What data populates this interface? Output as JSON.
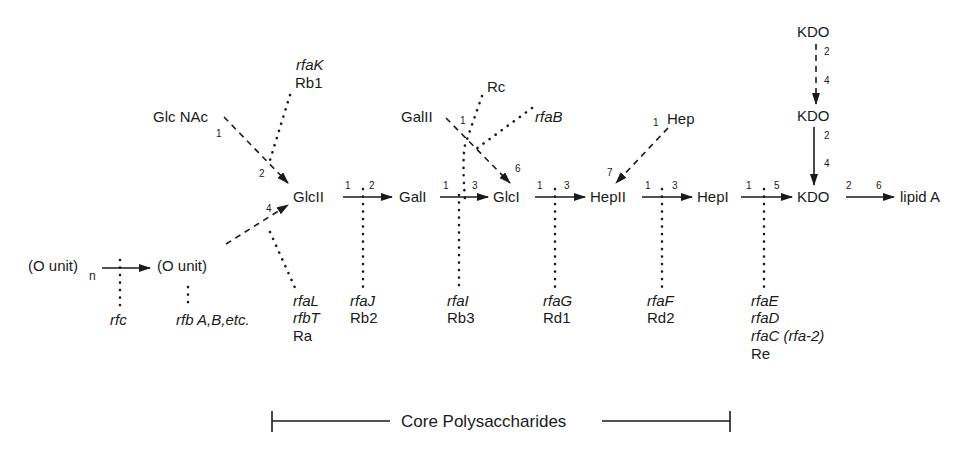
{
  "nodes": {
    "o_unit_n": "(O unit)",
    "o_unit_n_sub": "n",
    "o_unit": "(O unit)",
    "glcnac": "Glc NAc",
    "glcII": "GlcII",
    "galI": "GalI",
    "galII": "GalII",
    "glcI": "GlcI",
    "hep": "Hep",
    "hepII": "HepII",
    "hepI": "HepI",
    "kdo_top": "KDO",
    "kdo_mid": "KDO",
    "kdo_main": "KDO",
    "lipidA": "lipid A"
  },
  "linkages": {
    "glcnac_glcII": [
      "1",
      "2"
    ],
    "ounit_glcII": [
      "4"
    ],
    "glcII_galI": [
      "1",
      "2"
    ],
    "galI_glcI": [
      "1",
      "3"
    ],
    "galII_glcI": [
      "1",
      "6"
    ],
    "glcI_hepII": [
      "1",
      "3"
    ],
    "hep_hepII": [
      "1",
      "7"
    ],
    "hepII_hepI": [
      "1",
      "3"
    ],
    "hepI_kdo": [
      "1",
      "5"
    ],
    "kdo_top_mid": [
      "2",
      "4"
    ],
    "kdo_mid_main": [
      "2",
      "4"
    ],
    "kdo_lipidA": [
      "2",
      "6"
    ]
  },
  "genes": {
    "rfc": "rfc",
    "rfb": "rfb A,B,etc.",
    "rfaK": "rfaK",
    "rfaK_mut": "Rb1",
    "rc": "Rc",
    "rfaB": "rfaB",
    "rfaL": "rfaL",
    "rfbT": "rfbT",
    "ra": "Ra",
    "rfaJ": "rfaJ",
    "rfaJ_mut": "Rb2",
    "rfaI": "rfaI",
    "rfaI_mut": "Rb3",
    "rfaG": "rfaG",
    "rfaG_mut": "Rd1",
    "rfaF": "rfaF",
    "rfaF_mut": "Rd2",
    "rfaE": "rfaE",
    "rfaD": "rfaD",
    "rfaC": "rfaC (rfa-2)",
    "re": "Re"
  },
  "core_label": "Core Polysaccharides",
  "colors": {
    "ink": "#1a1a1a",
    "background": "#ffffff"
  }
}
